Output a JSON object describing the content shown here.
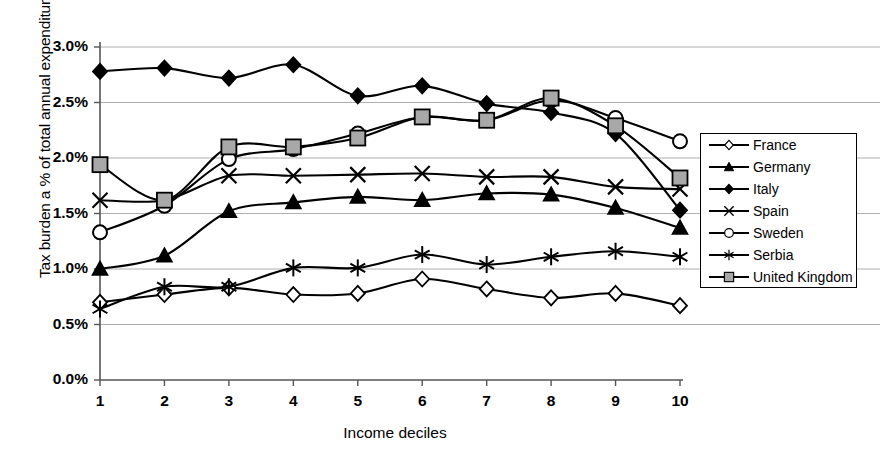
{
  "chart_data": {
    "type": "line",
    "title": "",
    "xlabel": "Income deciles",
    "ylabel": "Tax burden a % of total annual expenditures",
    "categories": [
      "1",
      "2",
      "3",
      "4",
      "5",
      "6",
      "7",
      "8",
      "9",
      "10"
    ],
    "x": [
      1,
      2,
      3,
      4,
      5,
      6,
      7,
      8,
      9,
      10
    ],
    "xlim": [
      1,
      10
    ],
    "ylim": [
      0,
      3
    ],
    "ytick_labels": [
      "0.0%",
      "0.5%",
      "1.0%",
      "1.5%",
      "2.0%",
      "2.5%",
      "3.0%"
    ],
    "ytick_values": [
      0,
      0.5,
      1.0,
      1.5,
      2.0,
      2.5,
      3.0
    ],
    "grid": "horizontal",
    "legend_position": "right",
    "value_unit": "%",
    "series": [
      {
        "name": "France",
        "marker": "open-diamond",
        "values": [
          0.7,
          0.77,
          0.83,
          0.77,
          0.78,
          0.91,
          0.82,
          0.74,
          0.78,
          0.67
        ]
      },
      {
        "name": "Germany",
        "marker": "filled-triangle",
        "values": [
          1.0,
          1.12,
          1.52,
          1.6,
          1.65,
          1.62,
          1.68,
          1.67,
          1.55,
          1.37
        ]
      },
      {
        "name": "Italy",
        "marker": "filled-diamond",
        "values": [
          2.78,
          2.81,
          2.72,
          2.84,
          2.56,
          2.65,
          2.49,
          2.41,
          2.22,
          1.53
        ]
      },
      {
        "name": "Spain",
        "marker": "x-cross",
        "values": [
          1.62,
          1.62,
          1.84,
          1.84,
          1.85,
          1.86,
          1.83,
          1.83,
          1.74,
          1.72
        ]
      },
      {
        "name": "Sweden",
        "marker": "open-circle",
        "values": [
          1.33,
          1.57,
          1.99,
          2.08,
          2.22,
          2.37,
          2.34,
          2.52,
          2.36,
          2.15
        ]
      },
      {
        "name": "Serbia",
        "marker": "asterisk",
        "values": [
          0.64,
          0.84,
          0.84,
          1.01,
          1.01,
          1.13,
          1.04,
          1.11,
          1.16,
          1.11
        ]
      },
      {
        "name": "United Kingdom",
        "marker": "filled-square-gray",
        "values": [
          1.94,
          1.62,
          2.1,
          2.1,
          2.18,
          2.37,
          2.34,
          2.54,
          2.29,
          1.82
        ]
      }
    ]
  },
  "axis": {
    "ylabel": "Tax burden a % of total annual expenditures",
    "xlabel": "Income deciles"
  },
  "legend": {
    "items": [
      {
        "label": "France"
      },
      {
        "label": "Germany"
      },
      {
        "label": "Italy"
      },
      {
        "label": "Spain"
      },
      {
        "label": "Sweden"
      },
      {
        "label": "Serbia"
      },
      {
        "label": "United Kingdom"
      }
    ]
  },
  "colors": {
    "line": "#000000",
    "grid": "#999999",
    "axis": "#555555",
    "uk_marker_fill": "#a8a8a8",
    "background": "#ffffff"
  }
}
